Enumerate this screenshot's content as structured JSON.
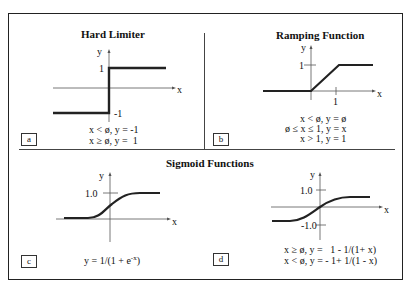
{
  "figure": {
    "panels": [
      {
        "id": "a",
        "title": "Hard Limiter",
        "axis_labels": {
          "x": "x",
          "y": "y"
        },
        "ticks": {
          "y_upper": "1",
          "y_lower": "-1"
        },
        "equations": [
          "x < ø, y = -1",
          "x ≥ ø, y =  1"
        ]
      },
      {
        "id": "b",
        "title": "Ramping Function",
        "axis_labels": {
          "x": "x",
          "y": "y"
        },
        "ticks": {
          "y_upper": "1",
          "x_tick": "1"
        },
        "equations": [
          "x < ø, y = ø",
          "ø ≤ x ≤ 1, y = x",
          "x > 1, y = 1"
        ]
      },
      {
        "id": "c",
        "axis_labels": {
          "x": "x",
          "y": "y"
        },
        "ticks": {
          "y_upper": "1.0"
        },
        "equation_main": "y = 1/(1 + e",
        "equation_sup": "-x",
        "equation_tail": ")"
      },
      {
        "id": "d",
        "axis_labels": {
          "x": "x",
          "y": "y"
        },
        "ticks": {
          "y_upper": "1.0",
          "y_lower": "-1.0"
        },
        "equations": [
          "x ≥ ø, y =   1 - 1/(1+ x)",
          "x < ø, y = - 1+ 1/(1 - x)"
        ]
      }
    ],
    "section_title_sigmoid": "Sigmoid Functions"
  }
}
